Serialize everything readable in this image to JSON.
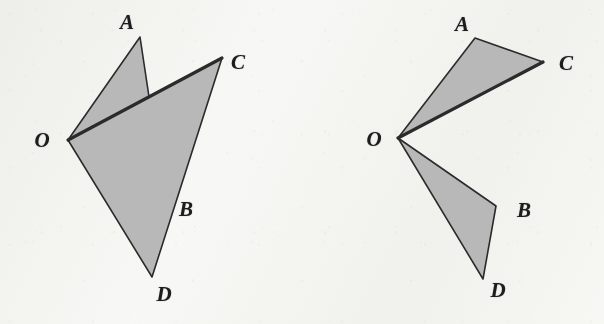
{
  "figure": {
    "title": "Two triangles sharing common vertex O — overlapping (left) and separated (right)",
    "width": 604,
    "height": 324,
    "background_color": "#f8f8f6",
    "fill_color": "#b8b8b8",
    "stroke_color": "#2b2b2b",
    "label_color": "#1d1d1d",
    "stroke_width": 1.6,
    "emphasis_stroke_width": 3.2
  },
  "diagram_data": {
    "type": "geometric-figure",
    "panels": [
      {
        "id": "left-panel",
        "name": "overlapping-triangles",
        "description": "Triangles OAB and OCD drawn overlapping about the shared vertex O",
        "points": {
          "O": {
            "x": 68,
            "y": 140
          },
          "A": {
            "x": 140,
            "y": 37
          },
          "B": {
            "x": 165,
            "y": 203
          },
          "C": {
            "x": 222,
            "y": 58
          },
          "D": {
            "x": 152,
            "y": 277
          }
        },
        "shapes": [
          {
            "name": "triangle-OAB",
            "vertices": [
              "O",
              "A",
              "B"
            ]
          },
          {
            "name": "triangle-OCD",
            "vertices": [
              "O",
              "C",
              "D"
            ]
          }
        ],
        "emphasized_edges": [
          {
            "name": "segment-OC",
            "from": "O",
            "to": "C"
          }
        ],
        "labels": [
          {
            "text": "O",
            "x": 42,
            "y": 140
          },
          {
            "text": "A",
            "x": 127,
            "y": 22
          },
          {
            "text": "B",
            "x": 186,
            "y": 209
          },
          {
            "text": "C",
            "x": 238,
            "y": 62
          },
          {
            "text": "D",
            "x": 164,
            "y": 294
          }
        ]
      },
      {
        "id": "right-panel",
        "name": "separated-triangles",
        "description": "Triangles OAC and OBD drawn apart, still sharing vertex O",
        "points": {
          "O": {
            "x": 398,
            "y": 138
          },
          "A": {
            "x": 475,
            "y": 38
          },
          "B": {
            "x": 496,
            "y": 206
          },
          "C": {
            "x": 543,
            "y": 62
          },
          "D": {
            "x": 483,
            "y": 279
          }
        },
        "shapes": [
          {
            "name": "triangle-OAC",
            "vertices": [
              "O",
              "A",
              "C"
            ]
          },
          {
            "name": "triangle-OBD",
            "vertices": [
              "O",
              "B",
              "D"
            ]
          }
        ],
        "emphasized_edges": [
          {
            "name": "segment-OC",
            "from": "O",
            "to": "C"
          }
        ],
        "labels": [
          {
            "text": "O",
            "x": 374,
            "y": 139
          },
          {
            "text": "A",
            "x": 462,
            "y": 24
          },
          {
            "text": "B",
            "x": 524,
            "y": 210
          },
          {
            "text": "C",
            "x": 566,
            "y": 63
          },
          {
            "text": "D",
            "x": 498,
            "y": 290
          }
        ]
      }
    ]
  }
}
